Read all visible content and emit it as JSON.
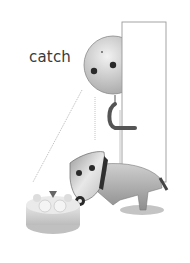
{
  "illustration": {
    "caption": "catch",
    "elements": [
      "door",
      "puppet-figure",
      "puppet-dog",
      "cake",
      "marionette-strings"
    ],
    "colors": {
      "background": "#ffffff",
      "text": "#3a3a3a",
      "figure_gray": "#c8c8c8",
      "dark": "#2a2a2a",
      "door_outline": "#9a9a9a"
    }
  }
}
